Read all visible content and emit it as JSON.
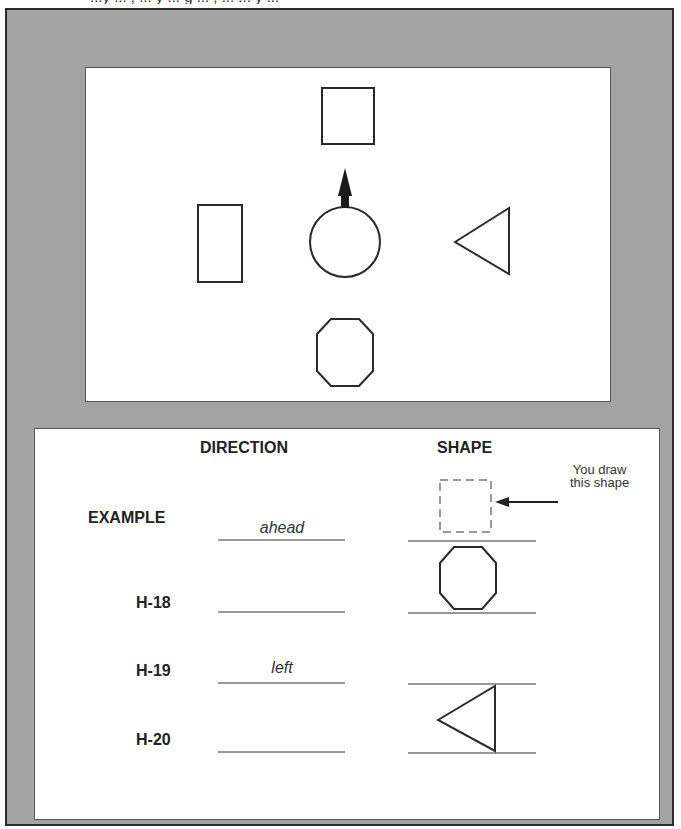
{
  "header": {
    "clipped_text": "...y ... , ... y ... g ... , ... ... y ..."
  },
  "map_panel": {
    "center_shape": "circle",
    "arrow_direction": "up",
    "shapes": [
      {
        "position": "ahead",
        "shape": "square"
      },
      {
        "position": "left",
        "shape": "rectangle"
      },
      {
        "position": "right",
        "shape": "triangle"
      },
      {
        "position": "behind",
        "shape": "octagon"
      }
    ]
  },
  "answers": {
    "column_headers": {
      "direction": "DIRECTION",
      "shape": "SHAPE"
    },
    "rows": [
      {
        "label": "EXAMPLE",
        "direction": "ahead",
        "shape": "square (dashed)"
      },
      {
        "label": "H-18",
        "direction": "",
        "shape": "octagon"
      },
      {
        "label": "H-19",
        "direction": "left",
        "shape": ""
      },
      {
        "label": "H-20",
        "direction": "",
        "shape": "triangle"
      }
    ],
    "note_line1": "You draw",
    "note_line2": "this shape"
  },
  "colors": {
    "frame": "#a3a3a3",
    "stroke": "#2a2a2a",
    "dashed": "#777777"
  }
}
